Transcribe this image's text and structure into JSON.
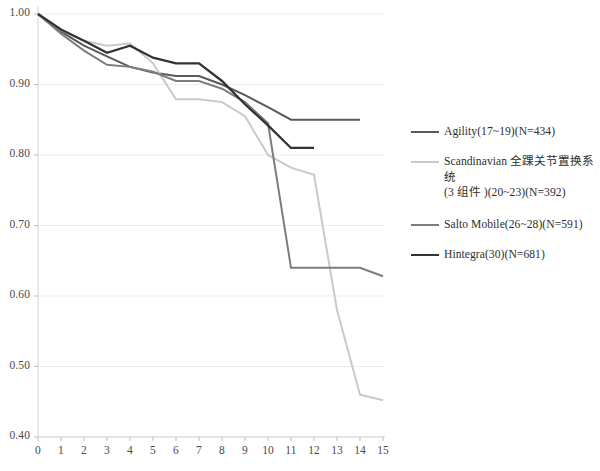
{
  "chart_data": {
    "type": "line",
    "title": "",
    "subtitle": "",
    "xlabel": "",
    "ylabel": "",
    "xlim": [
      0,
      15
    ],
    "ylim": [
      0.4,
      1.0
    ],
    "xticks": [
      "0",
      "1",
      "2",
      "3",
      "4",
      "5",
      "6",
      "7",
      "8",
      "9",
      "10",
      "11",
      "12",
      "13",
      "14",
      "15"
    ],
    "yticks": [
      "0.40",
      "0.50",
      "0.60",
      "0.70",
      "0.80",
      "0.90",
      "1.00"
    ],
    "grid": "horizontal",
    "legend_position": "right",
    "x": [
      0,
      1,
      2,
      3,
      4,
      5,
      6,
      7,
      8,
      9,
      10,
      11,
      12,
      13,
      14,
      15
    ],
    "series": [
      {
        "name": "Agility(17~19)(N=434)",
        "label": "Agility(17~19)(N=434)",
        "color": "#595959",
        "linewidth": 2.0,
        "values": [
          1.0,
          0.975,
          0.955,
          0.94,
          0.925,
          0.917,
          0.912,
          0.912,
          0.9,
          0.885,
          0.868,
          0.85,
          0.85,
          0.85,
          0.85,
          null
        ]
      },
      {
        "name": "Scandinavian 全踝关节置换系统(3 组件 )(20~23)(N=392)",
        "label_line1": "Scandinavian 全踝关节置换系统",
        "label_line2": "(3 组件 )(20~23)(N=392)",
        "color": "#c9c9c9",
        "linewidth": 2.0,
        "values": [
          1.0,
          0.977,
          0.962,
          0.955,
          0.958,
          0.93,
          0.879,
          0.879,
          0.875,
          0.855,
          0.8,
          0.782,
          0.772,
          0.58,
          0.46,
          0.452
        ]
      },
      {
        "name": "Salto Mobile(26~28)(N=591)",
        "label": "Salto Mobile(26~28)(N=591)",
        "color": "#7d7d7d",
        "linewidth": 2.0,
        "values": [
          1.0,
          0.972,
          0.948,
          0.928,
          0.925,
          0.918,
          0.905,
          0.905,
          0.894,
          0.875,
          0.845,
          0.64,
          0.64,
          0.64,
          0.64,
          0.628
        ]
      },
      {
        "name": "Hintegra(30)(N=681)",
        "label": "Hintegra(30)(N=681)",
        "color": "#333333",
        "linewidth": 2.3,
        "values": [
          1.0,
          0.978,
          0.962,
          0.945,
          0.955,
          0.938,
          0.93,
          0.93,
          0.905,
          0.872,
          0.842,
          0.81,
          0.81,
          null,
          null,
          null
        ]
      }
    ]
  },
  "legend": {
    "entries": [
      {
        "text": "Agility(17~19)(N=434)",
        "color": "#595959"
      },
      {
        "text_line1": "Scandinavian 全踝关节置换系统",
        "text_line2": "(3 组件 )(20~23)(N=392)",
        "color": "#c9c9c9"
      },
      {
        "text": "Salto Mobile(26~28)(N=591)",
        "color": "#7d7d7d"
      },
      {
        "text": "Hintegra(30)(N=681)",
        "color": "#333333"
      }
    ]
  },
  "axes": {
    "y_labels": [
      "1.00",
      "0.90",
      "0.80",
      "0.70",
      "0.60",
      "0.50",
      "0.40"
    ],
    "x_labels": [
      "0",
      "1",
      "2",
      "3",
      "4",
      "5",
      "6",
      "7",
      "8",
      "9",
      "10",
      "11",
      "12",
      "13",
      "14",
      "15"
    ]
  }
}
